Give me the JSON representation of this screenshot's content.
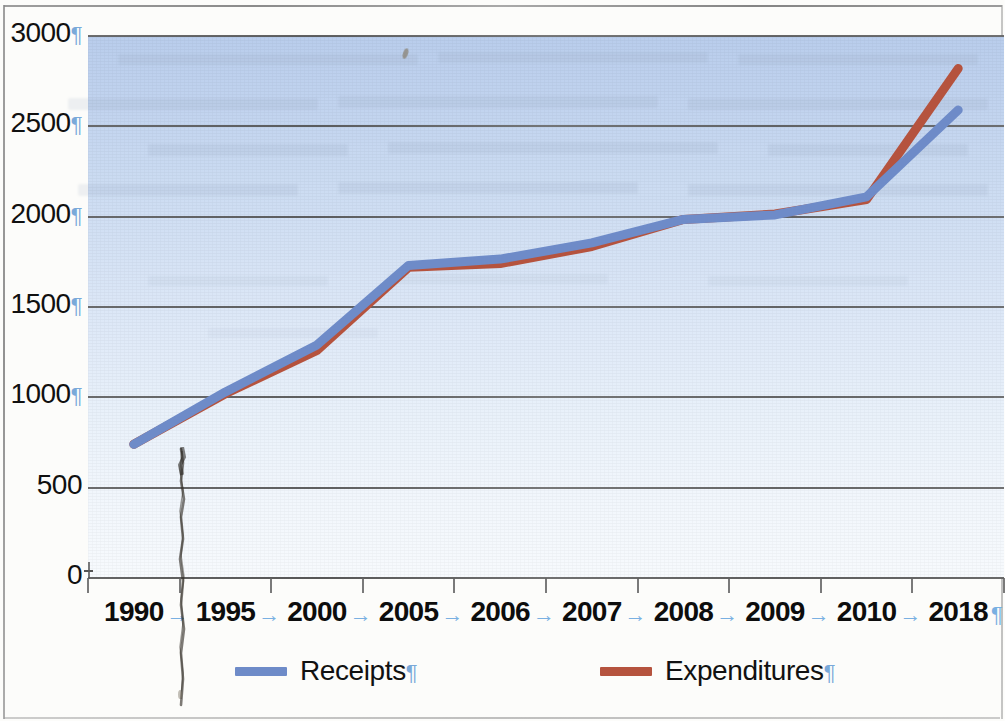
{
  "chart_data": {
    "type": "line",
    "title": "",
    "xlabel": "",
    "ylabel": "",
    "categories": [
      "1990",
      "1995",
      "2000",
      "2005",
      "2006",
      "2007",
      "2008",
      "2009",
      "2010",
      "2018"
    ],
    "series": [
      {
        "name": "Receipts",
        "color": "#6e8bc8",
        "values": [
          740,
          1030,
          1290,
          1730,
          1765,
          1855,
          1985,
          2010,
          2110,
          2590
        ]
      },
      {
        "name": "Expenditures",
        "color": "#b5533e",
        "values": [
          740,
          1020,
          1260,
          1720,
          1740,
          1835,
          1985,
          2015,
          2095,
          2820
        ]
      }
    ],
    "ylim": [
      0,
      3000
    ],
    "ytick_values": [
      "3000",
      "2500",
      "2000",
      "1500",
      "1000",
      "500",
      "0"
    ],
    "ytick_step": 500,
    "grid": true,
    "legend_position": "bottom"
  },
  "axis": {
    "y_labels": [
      {
        "text": "3000",
        "mark": "¶"
      },
      {
        "text": "2500",
        "mark": "¶"
      },
      {
        "text": "2000",
        "mark": "¶"
      },
      {
        "text": "1500",
        "mark": "¶"
      },
      {
        "text": "1000",
        "mark": "¶"
      },
      {
        "text": "500",
        "mark": ""
      },
      {
        "text": "0",
        "mark": ""
      }
    ],
    "x_labels": [
      "1990",
      "1995",
      "2000",
      "2005",
      "2006",
      "2007",
      "2008",
      "2009",
      "2010",
      "2018"
    ],
    "x_separator_mark": "→",
    "x_end_mark": "¶"
  },
  "legend": {
    "items": [
      {
        "label": "Receipts",
        "mark": "¶",
        "color": "#6e8bc8"
      },
      {
        "label": "Expenditures",
        "mark": "¶",
        "color": "#b5533e"
      }
    ]
  },
  "colors": {
    "receipts": "#6e8bc8",
    "expenditures": "#b5533e",
    "plot_top": "#b9cdec",
    "plot_bottom": "#f7fafd",
    "gridline": "#555555",
    "formatting_mark": "#7aa9d9"
  }
}
